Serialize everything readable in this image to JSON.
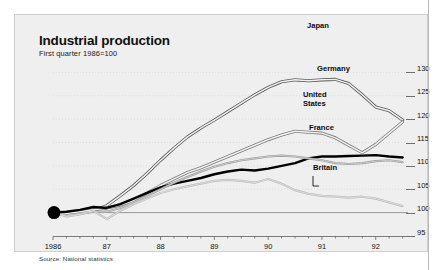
{
  "header": {
    "title": "Industrial production",
    "subtitle": "First quarter 1986=100"
  },
  "footer": {
    "source": "Source: National statistics"
  },
  "labels": {
    "japan": "Japan",
    "germany": "Germany",
    "united": "United",
    "states": "States",
    "france": "France",
    "britain": "Britain"
  },
  "colors": {
    "panel_background": "#efefef",
    "japan": "#5a5a5a",
    "germany": "#7d7d7d",
    "united_states": "#000000",
    "france": "#9a9a9a",
    "britain": "#bdbdbd",
    "axis": "#6f6f6f",
    "baseline": "#8c8c8c"
  },
  "chart_data": {
    "type": "line",
    "title": "Industrial production",
    "subtitle": "First quarter 1986=100",
    "xlabel": "",
    "ylabel": "",
    "ylim": [
      95,
      132
    ],
    "yticks": [
      95,
      100,
      105,
      110,
      115,
      120,
      125,
      130
    ],
    "xlim": [
      1986,
      1992.6
    ],
    "xticks": [
      1986,
      1987,
      1988,
      1989,
      1990,
      1991,
      1992
    ],
    "xticklabels": [
      "1986",
      "87",
      "88",
      "89",
      "90",
      "91",
      "92"
    ],
    "grid": "dotted-horizontal",
    "legend": "inline-annotations",
    "baseline_value": 100,
    "origin_marker": {
      "x": 1986.0,
      "y": 100,
      "style": "filled-circle"
    },
    "x": [
      1986.0,
      1986.25,
      1986.5,
      1986.75,
      1987.0,
      1987.25,
      1987.5,
      1987.75,
      1988.0,
      1988.25,
      1988.5,
      1988.75,
      1989.0,
      1989.25,
      1989.5,
      1989.75,
      1990.0,
      1990.25,
      1990.5,
      1990.75,
      1991.0,
      1991.25,
      1991.5,
      1991.75,
      1992.0,
      1992.25,
      1992.5
    ],
    "series": [
      {
        "name": "Japan",
        "values": [
          100.0,
          99.6,
          99.8,
          100.4,
          101.5,
          103.6,
          105.8,
          108.4,
          111.2,
          113.8,
          116.2,
          118.1,
          119.8,
          121.6,
          123.4,
          125.2,
          126.8,
          128.0,
          128.4,
          128.2,
          128.4,
          128.5,
          127.6,
          125.2,
          122.6,
          121.8,
          119.8
        ],
        "color": "#5a5a5a",
        "width": 2.0,
        "style": "double-stroke"
      },
      {
        "name": "Germany",
        "values": [
          100.0,
          99.8,
          100.2,
          100.6,
          101.0,
          101.6,
          102.6,
          104.2,
          105.8,
          107.2,
          108.6,
          109.6,
          110.8,
          112.0,
          113.2,
          114.4,
          115.6,
          116.6,
          117.4,
          117.2,
          117.0,
          116.0,
          114.4,
          112.8,
          114.6,
          117.0,
          119.4
        ],
        "color": "#7d7d7d",
        "width": 2.0,
        "style": "double-stroke"
      },
      {
        "name": "United States",
        "values": [
          100.0,
          100.2,
          100.6,
          101.2,
          101.0,
          101.8,
          103.0,
          104.2,
          105.4,
          106.2,
          106.8,
          107.4,
          108.2,
          108.8,
          109.2,
          109.0,
          109.4,
          110.0,
          110.6,
          111.6,
          112.0,
          112.0,
          112.1,
          112.2,
          112.3,
          112.0,
          111.8
        ],
        "color": "#000000",
        "width": 2.4,
        "style": "solid"
      },
      {
        "name": "France",
        "values": [
          100.0,
          99.4,
          99.8,
          100.2,
          100.2,
          101.0,
          102.2,
          103.6,
          105.0,
          106.4,
          107.6,
          108.8,
          109.8,
          110.6,
          111.2,
          111.6,
          112.0,
          112.2,
          112.0,
          111.6,
          111.2,
          110.6,
          110.4,
          110.6,
          111.0,
          111.2,
          110.8
        ],
        "color": "#9a9a9a",
        "width": 1.1,
        "style": "double-stroke"
      },
      {
        "name": "Britain",
        "values": [
          100.0,
          99.2,
          99.6,
          100.4,
          98.6,
          100.4,
          101.8,
          103.0,
          104.2,
          105.0,
          105.6,
          106.2,
          106.8,
          107.0,
          106.8,
          106.4,
          107.2,
          106.2,
          104.8,
          104.0,
          103.6,
          103.4,
          103.2,
          103.4,
          103.0,
          102.2,
          101.4
        ],
        "color": "#bdbdbd",
        "width": 1.1,
        "style": "double-stroke"
      }
    ]
  }
}
